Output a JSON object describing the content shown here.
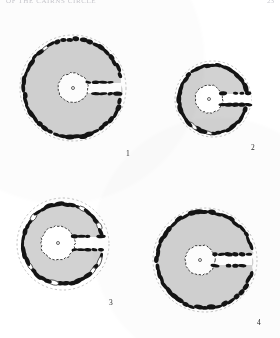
{
  "header": {
    "running_title": "OF THE CAIRNS CIRCLE",
    "folio": "23"
  },
  "colors": {
    "page_background": "#ffffff",
    "chamber_fill": "#d2d2d2",
    "stone_fill": "#141414",
    "void_fill": "#ffffff",
    "outline_dashed": "#9a9a9a",
    "caption_text": "#2a2a2a",
    "header_text": "#c9c9cf"
  },
  "figures": [
    {
      "id": "figure-1",
      "caption": "1",
      "center_x": 73,
      "center_y": 88,
      "outer_radius": 53,
      "kerb_radius": 49,
      "chamber_radius": 15,
      "chamber_center_x": 73,
      "chamber_center_y": 88,
      "passage_bearing_deg": 0,
      "passage_length": 48,
      "passage_half_width": 5,
      "has_central_marker": true,
      "central_marker_label": "o",
      "stone_count": 46,
      "description": "large circular chamber with continuous orthostat kerb and single east passage"
    },
    {
      "id": "figure-2",
      "caption": "2",
      "center_x": 213,
      "center_y": 99,
      "outer_radius": 38,
      "kerb_radius": 34,
      "chamber_radius": 14,
      "chamber_center_x": 209,
      "chamber_center_y": 99,
      "passage_bearing_deg": 0,
      "passage_length": 42,
      "passage_half_width": 5,
      "has_central_marker": true,
      "central_marker_label": "o",
      "stone_count": 40,
      "description": "smaller sub-circular chamber, wide central void, passage opening through east kerb"
    },
    {
      "id": "figure-3",
      "caption": "3",
      "center_x": 63,
      "center_y": 244,
      "outer_radius": 46,
      "kerb_radius": 40,
      "chamber_radius": 17,
      "chamber_center_x": 58,
      "chamber_center_y": 243,
      "passage_bearing_deg": 0,
      "passage_length": 46,
      "passage_half_width": 6,
      "has_central_marker": true,
      "central_marker_label": "o",
      "stone_count": 42,
      "description": "chamber with heavy blocked orthostats and white infill stones, twin-walled passage"
    },
    {
      "id": "figure-4",
      "caption": "4",
      "center_x": 205,
      "center_y": 260,
      "outer_radius": 52,
      "kerb_radius": 48,
      "chamber_radius": 15,
      "chamber_center_x": 200,
      "chamber_center_y": 260,
      "passage_bearing_deg": 0,
      "passage_length": 52,
      "passage_half_width": 5,
      "has_central_marker": true,
      "central_marker_label": "o",
      "stone_count": 44,
      "description": "large chamber, near-continuous dark kerb, straight east passage to outer edge"
    }
  ]
}
